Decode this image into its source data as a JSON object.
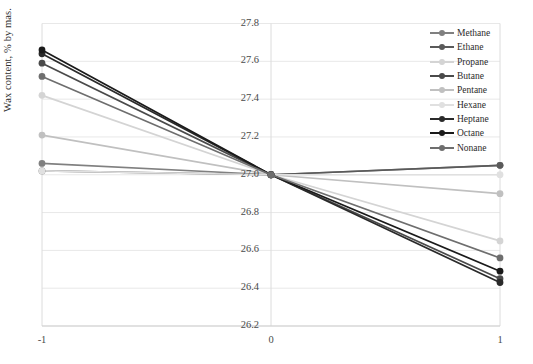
{
  "chart_data": {
    "type": "line",
    "title": "",
    "xlabel": "",
    "ylabel": "Wax content, % by mas.",
    "x": [
      -1,
      0,
      1
    ],
    "xticklabels": [
      "-1",
      "0",
      "1"
    ],
    "xlim": [
      -1,
      1
    ],
    "ylim": [
      26.2,
      27.8
    ],
    "yticks": [
      27.8,
      27.6,
      27.4,
      27.2,
      27.0,
      26.8,
      26.6,
      26.4,
      26.2
    ],
    "yticklabels": [
      "27.8",
      "27.6",
      "27.4",
      "27.2",
      "27.0",
      "26.8",
      "26.6",
      "26.4",
      "26.2"
    ],
    "grid": true,
    "legend_position": "top-right",
    "series": [
      {
        "name": "Methane",
        "color": "#808080",
        "values": [
          27.06,
          27.0,
          27.05
        ]
      },
      {
        "name": "Ethane",
        "color": "#5a5a5a",
        "values": [
          27.02,
          27.0,
          27.05
        ]
      },
      {
        "name": "Propane",
        "color": "#d4d4d4",
        "values": [
          27.42,
          27.0,
          26.65
        ]
      },
      {
        "name": "Butane",
        "color": "#4a4a4a",
        "values": [
          27.59,
          27.0,
          26.45
        ]
      },
      {
        "name": "Pentane",
        "color": "#c0c0c0",
        "values": [
          27.21,
          27.0,
          26.9
        ]
      },
      {
        "name": "Hexane",
        "color": "#e0e0e0",
        "values": [
          27.02,
          27.0,
          27.0
        ]
      },
      {
        "name": "Heptane",
        "color": "#2a2a2a",
        "values": [
          27.64,
          27.0,
          26.43
        ]
      },
      {
        "name": "Octane",
        "color": "#1a1a1a",
        "values": [
          27.66,
          27.0,
          26.49
        ]
      },
      {
        "name": "Nonane",
        "color": "#6e6e6e",
        "values": [
          27.52,
          27.0,
          26.56
        ]
      }
    ]
  },
  "axis": {
    "y_label_text": "Wax content, % by mas."
  },
  "legend": {
    "items": [
      {
        "label": "Methane"
      },
      {
        "label": "Ethane"
      },
      {
        "label": "Propane"
      },
      {
        "label": "Butane"
      },
      {
        "label": "Pentane"
      },
      {
        "label": "Hexane"
      },
      {
        "label": "Heptane"
      },
      {
        "label": "Octane"
      },
      {
        "label": "Nonane"
      }
    ]
  }
}
